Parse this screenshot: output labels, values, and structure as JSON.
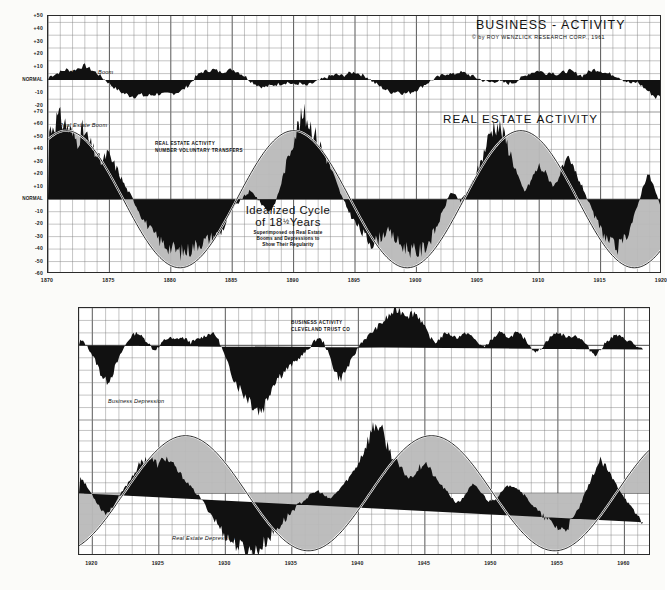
{
  "document": {
    "title": "BUSINESS - ACTIVITY",
    "copyright": "© by ROY WENZLICK RESEARCH CORP., 1961",
    "subtitle_real_estate": "REAL ESTATE ACTIVITY"
  },
  "annotations": {
    "business_boom": "Business Boom",
    "real_estate_boom": "Real Estate Boom",
    "business_depression": "Business Depression",
    "real_estate_depression": "Real Estate Depression",
    "re_activity_line1": "REAL ESTATE ACTIVITY",
    "re_activity_line2": "NUMBER VOLUNTARY TRANSFERS",
    "business_activity_line1": "BUSINESS ACTIVITY",
    "business_activity_line2": "CLEVELAND TRUST CO",
    "idealized_line1": "Idealized Cycle",
    "idealized_line2_pre": "of 18",
    "idealized_line2_frac": "½",
    "idealized_line2_post": "Years",
    "idealized_sub1": "Superimposed on Real Estate",
    "idealized_sub2": "Booms and Depressions to",
    "idealized_sub3": "Show Their Regularity"
  },
  "colors": {
    "ink": "#1a1a1a",
    "grid_minor": "#7d7d7d",
    "grid_major": "#3a3a3a",
    "series_fill": "#111111",
    "cycle_shade": "#b9b9b9",
    "cycle_line": "#000000",
    "paper": "#fbfbf9"
  },
  "chart_data": [
    {
      "id": "top-business",
      "type": "area",
      "title": "BUSINESS - ACTIVITY",
      "ylabel": "",
      "xlabel": "",
      "ylim": [
        -25,
        50
      ],
      "xlim": [
        1870,
        1920
      ],
      "grid": true,
      "legend": "none",
      "yticks": [
        "+50",
        "+40",
        "+30",
        "+20",
        "+10",
        "NORMAL",
        "-10",
        "-20"
      ],
      "ytick_values": [
        50,
        40,
        30,
        20,
        10,
        0,
        -10,
        -20
      ],
      "xticks": [
        "1870",
        "1875",
        "1880",
        "1885",
        "1890",
        "1895",
        "1900",
        "1905",
        "1910",
        "1915",
        "1920"
      ],
      "xtick_values": [
        1870,
        1875,
        1880,
        1885,
        1890,
        1895,
        1900,
        1905,
        1910,
        1915,
        1920
      ],
      "baseline": 0,
      "x": [
        1870.0,
        1870.5,
        1871.0,
        1871.5,
        1872.0,
        1872.5,
        1873.0,
        1873.5,
        1874.0,
        1874.5,
        1875.0,
        1875.5,
        1876.0,
        1876.5,
        1877.0,
        1877.5,
        1878.0,
        1878.5,
        1879.0,
        1879.5,
        1880.0,
        1880.5,
        1881.0,
        1881.5,
        1882.0,
        1882.5,
        1883.0,
        1883.5,
        1884.0,
        1884.5,
        1885.0,
        1885.5,
        1886.0,
        1886.5,
        1887.0,
        1887.5,
        1888.0,
        1888.5,
        1889.0,
        1889.5,
        1890.0,
        1890.5,
        1891.0,
        1891.5,
        1892.0,
        1892.5,
        1893.0,
        1893.5,
        1894.0,
        1894.5,
        1895.0,
        1895.5,
        1896.0,
        1896.5,
        1897.0,
        1897.5,
        1898.0,
        1898.5,
        1899.0,
        1899.5,
        1900.0,
        1900.5,
        1901.0,
        1901.5,
        1902.0,
        1902.5,
        1903.0,
        1903.5,
        1904.0,
        1904.5,
        1905.0,
        1905.5,
        1906.0,
        1906.5,
        1907.0,
        1907.5,
        1908.0,
        1908.5,
        1909.0,
        1909.5,
        1910.0,
        1910.5,
        1911.0,
        1911.5,
        1912.0,
        1912.5,
        1913.0,
        1913.5,
        1914.0,
        1914.5,
        1915.0,
        1915.5,
        1916.0,
        1916.5,
        1917.0,
        1917.5,
        1918.0,
        1918.5,
        1919.0,
        1919.5,
        1920.0
      ],
      "values": [
        2,
        4,
        6,
        8,
        7,
        9,
        11,
        8,
        5,
        1,
        -3,
        -7,
        -10,
        -12,
        -13,
        -12,
        -13,
        -12,
        -11,
        -12,
        -11,
        -10,
        -8,
        -4,
        2,
        6,
        7,
        8,
        6,
        7,
        8,
        6,
        3,
        -1,
        -4,
        -6,
        -5,
        -4,
        -3,
        -2,
        -4,
        -3,
        -5,
        -3,
        -1,
        1,
        3,
        4,
        3,
        5,
        6,
        4,
        2,
        -2,
        -5,
        -8,
        -10,
        -9,
        -11,
        -10,
        -8,
        -5,
        -2,
        1,
        3,
        5,
        4,
        6,
        5,
        3,
        1,
        -1,
        -2,
        -1,
        -2,
        -3,
        -2,
        1,
        4,
        6,
        7,
        5,
        6,
        4,
        6,
        7,
        5,
        3,
        6,
        8,
        7,
        5,
        4,
        2,
        -1,
        -3,
        -2,
        -6,
        -10,
        -14,
        -12,
        -17,
        -20,
        -15,
        -7,
        2,
        6,
        4,
        7,
        5,
        3,
        6,
        8,
        6,
        4,
        -2,
        -8
      ],
      "annotation": "Business Boom"
    },
    {
      "id": "top-realestate",
      "type": "area",
      "title": "REAL ESTATE ACTIVITY",
      "ylabel": "",
      "xlabel": "",
      "ylim": [
        -60,
        70
      ],
      "xlim": [
        1870,
        1920
      ],
      "grid": true,
      "legend": "none",
      "yticks": [
        "+70",
        "+60",
        "+50",
        "+40",
        "+30",
        "+20",
        "+10",
        "NORMAL",
        "-10",
        "-20",
        "-30",
        "-40",
        "-50",
        "-60"
      ],
      "ytick_values": [
        70,
        60,
        50,
        40,
        30,
        20,
        10,
        0,
        -10,
        -20,
        -30,
        -40,
        -50,
        -60
      ],
      "baseline": 0,
      "series_label": "NUMBER VOLUNTARY TRANSFERS",
      "x": [
        1870.0,
        1870.4,
        1870.8,
        1871.2,
        1871.6,
        1872.0,
        1872.4,
        1872.8,
        1873.2,
        1873.6,
        1874.0,
        1874.4,
        1874.8,
        1875.2,
        1875.6,
        1876.0,
        1876.4,
        1876.8,
        1877.2,
        1877.6,
        1878.0,
        1878.4,
        1878.8,
        1879.2,
        1879.6,
        1880.0,
        1880.4,
        1880.8,
        1881.2,
        1881.6,
        1882.0,
        1882.4,
        1882.8,
        1883.2,
        1883.6,
        1884.0,
        1884.4,
        1884.8,
        1885.2,
        1885.6,
        1886.0,
        1886.4,
        1886.8,
        1887.2,
        1887.6,
        1888.0,
        1888.4,
        1888.8,
        1889.2,
        1889.6,
        1890.0,
        1890.4,
        1890.8,
        1891.2,
        1891.6,
        1892.0,
        1892.4,
        1892.8,
        1893.2,
        1893.6,
        1894.0,
        1894.4,
        1894.8,
        1895.2,
        1895.6,
        1896.0,
        1896.4,
        1896.8,
        1897.2,
        1897.6,
        1898.0,
        1898.4,
        1898.8,
        1899.2,
        1899.6,
        1900.0,
        1900.4,
        1900.8,
        1901.2,
        1901.6,
        1902.0,
        1902.4,
        1902.8,
        1903.2,
        1903.6,
        1904.0,
        1904.4,
        1904.8,
        1905.2,
        1905.6,
        1906.0,
        1906.4,
        1906.8,
        1907.2,
        1907.6,
        1908.0,
        1908.4,
        1908.8,
        1909.2,
        1909.6,
        1910.0,
        1910.4,
        1910.8,
        1911.2,
        1911.6,
        1912.0,
        1912.4,
        1912.8,
        1913.2,
        1913.6,
        1914.0,
        1914.4,
        1914.8,
        1915.2,
        1915.6,
        1916.0,
        1916.4,
        1916.8,
        1917.2,
        1917.6,
        1918.0,
        1918.4,
        1918.8,
        1919.2,
        1919.6,
        1920.0
      ],
      "values": [
        52,
        58,
        64,
        61,
        57,
        50,
        46,
        54,
        48,
        40,
        34,
        28,
        36,
        30,
        24,
        16,
        8,
        2,
        -6,
        -14,
        -20,
        -26,
        -31,
        -35,
        -38,
        -40,
        -42,
        -44,
        -43,
        -41,
        -38,
        -36,
        -34,
        -32,
        -30,
        -28,
        -22,
        -12,
        -6,
        -2,
        2,
        6,
        4,
        -2,
        -6,
        -10,
        -6,
        6,
        20,
        34,
        48,
        58,
        66,
        62,
        54,
        46,
        38,
        30,
        20,
        10,
        0,
        -8,
        -16,
        -22,
        -28,
        -33,
        -36,
        -34,
        -30,
        -26,
        -30,
        -34,
        -38,
        -40,
        -42,
        -44,
        -42,
        -38,
        -32,
        -24,
        -14,
        -4,
        6,
        2,
        -2,
        4,
        10,
        18,
        28,
        40,
        52,
        60,
        56,
        48,
        38,
        26,
        14,
        6,
        12,
        20,
        26,
        22,
        16,
        10,
        18,
        26,
        30,
        24,
        16,
        8,
        -2,
        -12,
        -20,
        -28,
        -34,
        -38,
        -40,
        -36,
        -28,
        -18,
        -6,
        8,
        20,
        14,
        2,
        -10,
        -22,
        -30
      ],
      "annotation": "Real Estate Boom"
    },
    {
      "id": "top-idealized-cycle",
      "type": "line",
      "title": "Idealized Cycle of 18½ Years",
      "description": "Superimposed on Real Estate Booms and Depressions to Show Their Regularity",
      "period_years": 18.5,
      "amplitude": 55,
      "phase_peak_years": [
        1871.5,
        1890.0,
        1908.5
      ],
      "phase_trough_years": [
        1880.75,
        1899.25,
        1917.75
      ],
      "xlim": [
        1870,
        1920
      ]
    },
    {
      "id": "bottom-business",
      "type": "area",
      "title": "BUSINESS ACTIVITY",
      "source_label": "CLEVELAND TRUST CO",
      "ylim": [
        -60,
        30
      ],
      "xlim": [
        1919,
        1962
      ],
      "grid": true,
      "legend": "none",
      "baseline": 0,
      "xticks": [
        "1920",
        "1925",
        "1930",
        "1935",
        "1940",
        "1945",
        "1950",
        "1955",
        "1960"
      ],
      "xtick_values": [
        1920,
        1925,
        1930,
        1935,
        1940,
        1945,
        1950,
        1955,
        1960
      ],
      "x": [
        1919.0,
        1919.4,
        1919.8,
        1920.2,
        1920.6,
        1921.0,
        1921.4,
        1921.8,
        1922.2,
        1922.6,
        1923.0,
        1923.4,
        1923.8,
        1924.2,
        1924.6,
        1925.0,
        1925.4,
        1925.8,
        1926.2,
        1926.6,
        1927.0,
        1927.4,
        1927.8,
        1928.2,
        1928.6,
        1929.0,
        1929.4,
        1929.8,
        1930.2,
        1930.6,
        1931.0,
        1931.4,
        1931.8,
        1932.2,
        1932.6,
        1933.0,
        1933.4,
        1933.8,
        1934.2,
        1934.6,
        1935.0,
        1935.4,
        1935.8,
        1936.2,
        1936.6,
        1937.0,
        1937.4,
        1937.8,
        1938.2,
        1938.6,
        1939.0,
        1939.4,
        1939.8,
        1940.2,
        1940.6,
        1941.0,
        1941.4,
        1941.8,
        1942.2,
        1942.6,
        1943.0,
        1943.4,
        1943.8,
        1944.2,
        1944.6,
        1945.0,
        1945.4,
        1945.8,
        1946.2,
        1946.6,
        1947.0,
        1947.4,
        1947.8,
        1948.2,
        1948.6,
        1949.0,
        1949.4,
        1949.8,
        1950.2,
        1950.6,
        1951.0,
        1951.4,
        1951.8,
        1952.2,
        1952.6,
        1953.0,
        1953.4,
        1953.8,
        1954.2,
        1954.6,
        1955.0,
        1955.4,
        1955.8,
        1956.2,
        1956.6,
        1957.0,
        1957.4,
        1957.8,
        1958.2,
        1958.6,
        1959.0,
        1959.4,
        1959.8,
        1960.2,
        1960.6,
        1961.0,
        1961.4,
        1961.8
      ],
      "values": [
        4,
        2,
        -4,
        -12,
        -22,
        -30,
        -26,
        -16,
        -6,
        2,
        8,
        10,
        6,
        2,
        -4,
        -2,
        4,
        6,
        4,
        6,
        5,
        2,
        4,
        6,
        8,
        10,
        6,
        -4,
        -16,
        -26,
        -34,
        -40,
        -44,
        -50,
        -54,
        -48,
        -36,
        -28,
        -24,
        -20,
        -16,
        -12,
        -8,
        -4,
        2,
        6,
        2,
        -8,
        -20,
        -28,
        -22,
        -14,
        -6,
        2,
        6,
        10,
        14,
        18,
        22,
        26,
        28,
        26,
        24,
        26,
        22,
        14,
        6,
        2,
        6,
        10,
        8,
        6,
        8,
        10,
        6,
        2,
        -2,
        2,
        6,
        10,
        8,
        6,
        10,
        8,
        4,
        -2,
        -6,
        -2,
        4,
        8,
        10,
        8,
        6,
        8,
        6,
        2,
        -4,
        -8,
        -4,
        2,
        6,
        8,
        6,
        4,
        2,
        -2,
        -4
      ],
      "annotation": "Business Depression"
    },
    {
      "id": "bottom-realestate",
      "type": "area",
      "title": "REAL ESTATE ACTIVITY",
      "ylim": [
        -60,
        70
      ],
      "xlim": [
        1919,
        1962
      ],
      "grid": true,
      "legend": "none",
      "baseline": 0,
      "x": [
        1919.0,
        1919.4,
        1919.8,
        1920.2,
        1920.6,
        1921.0,
        1921.4,
        1921.8,
        1922.2,
        1922.6,
        1923.0,
        1923.4,
        1923.8,
        1924.2,
        1924.6,
        1925.0,
        1925.4,
        1925.8,
        1926.2,
        1926.6,
        1927.0,
        1927.4,
        1927.8,
        1928.2,
        1928.6,
        1929.0,
        1929.4,
        1929.8,
        1930.2,
        1930.6,
        1931.0,
        1931.4,
        1931.8,
        1932.2,
        1932.6,
        1933.0,
        1933.4,
        1933.8,
        1934.2,
        1934.6,
        1935.0,
        1935.4,
        1935.8,
        1936.2,
        1936.6,
        1937.0,
        1937.4,
        1937.8,
        1938.2,
        1938.6,
        1939.0,
        1939.4,
        1939.8,
        1940.2,
        1940.6,
        1941.0,
        1941.4,
        1941.8,
        1942.2,
        1942.6,
        1943.0,
        1943.4,
        1943.8,
        1944.2,
        1944.6,
        1945.0,
        1945.4,
        1945.8,
        1946.2,
        1946.6,
        1947.0,
        1947.4,
        1947.8,
        1948.2,
        1948.6,
        1949.0,
        1949.4,
        1949.8,
        1950.2,
        1950.6,
        1951.0,
        1951.4,
        1951.8,
        1952.2,
        1952.6,
        1953.0,
        1953.4,
        1953.8,
        1954.2,
        1954.6,
        1955.0,
        1955.4,
        1955.8,
        1956.2,
        1956.6,
        1957.0,
        1957.4,
        1957.8,
        1958.2,
        1958.6,
        1959.0,
        1959.4,
        1959.8,
        1960.2,
        1960.6,
        1961.0,
        1961.4,
        1961.8
      ],
      "values": [
        18,
        10,
        2,
        -6,
        -14,
        -20,
        -16,
        -8,
        0,
        8,
        16,
        24,
        30,
        34,
        30,
        26,
        34,
        30,
        24,
        18,
        12,
        6,
        0,
        -6,
        -14,
        -22,
        -30,
        -38,
        -44,
        -48,
        -52,
        -54,
        -56,
        -58,
        -54,
        -48,
        -42,
        -36,
        -30,
        -24,
        -18,
        -12,
        -8,
        -4,
        0,
        2,
        -2,
        -6,
        -2,
        4,
        10,
        16,
        24,
        34,
        46,
        58,
        66,
        56,
        44,
        34,
        26,
        20,
        14,
        18,
        24,
        30,
        22,
        14,
        8,
        2,
        -4,
        -10,
        -6,
        2,
        8,
        4,
        -2,
        -8,
        -6,
        -2,
        4,
        8,
        6,
        2,
        -4,
        -10,
        -16,
        -22,
        -26,
        -30,
        -34,
        -36,
        -32,
        -24,
        -14,
        -2,
        10,
        22,
        30,
        24,
        16,
        8,
        0,
        -8,
        -16,
        -22,
        -28
      ],
      "annotation": "Real Estate Depression"
    },
    {
      "id": "bottom-idealized-cycle",
      "type": "line",
      "title": "Idealized Cycle of 18½ Years",
      "period_years": 18.5,
      "amplitude": 55,
      "phase_peak_years": [
        1927.0,
        1945.5
      ],
      "phase_trough_years": [
        1936.25,
        1954.75
      ],
      "xlim": [
        1919,
        1962
      ]
    }
  ]
}
